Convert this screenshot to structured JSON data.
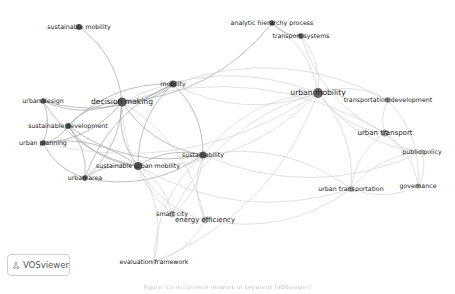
{
  "diagram": {
    "type": "co-occurrence keyword network",
    "nodes": [
      {
        "id": "sustainable_mobility",
        "label": "sustainable mobility",
        "x": 79,
        "y": 27,
        "r": 3,
        "color": "#555555",
        "size": "small"
      },
      {
        "id": "decision_making",
        "label": "decision making",
        "x": 122,
        "y": 102,
        "r": 4.5,
        "color": "#555555",
        "size": "big"
      },
      {
        "id": "mobility",
        "label": "mobility",
        "x": 173,
        "y": 84,
        "r": 3.5,
        "color": "#555555",
        "size": "small"
      },
      {
        "id": "urban_design",
        "label": "urban design",
        "x": 43,
        "y": 101,
        "r": 2.8,
        "color": "#555555",
        "size": "small"
      },
      {
        "id": "sustainable_development",
        "label": "sustainable development",
        "x": 68,
        "y": 126,
        "r": 3,
        "color": "#555555",
        "size": "small"
      },
      {
        "id": "urban_planning",
        "label": "urban planning",
        "x": 43,
        "y": 143,
        "r": 2.8,
        "color": "#555555",
        "size": "small"
      },
      {
        "id": "sustainable_urban_mobility",
        "label": "sustainable urban mobility",
        "x": 138,
        "y": 166,
        "r": 4,
        "color": "#555555",
        "size": "small"
      },
      {
        "id": "urban_area",
        "label": "urban area",
        "x": 85,
        "y": 178,
        "r": 2.8,
        "color": "#555555",
        "size": "small"
      },
      {
        "id": "sustainability",
        "label": "sustainability",
        "x": 203,
        "y": 155,
        "r": 3.5,
        "color": "#555555",
        "size": "small"
      },
      {
        "id": "smart_city",
        "label": "smart city",
        "x": 172,
        "y": 214,
        "r": 3.5,
        "color": "#bbbbbb",
        "size": "small"
      },
      {
        "id": "energy_efficiency",
        "label": "energy efficiency",
        "x": 205,
        "y": 220,
        "r": 3.5,
        "color": "#bbbbbb",
        "size": "med"
      },
      {
        "id": "evaluation_framework",
        "label": "evaluation framework",
        "x": 154,
        "y": 262,
        "r": 2.5,
        "color": "#cccccc",
        "size": "small"
      },
      {
        "id": "analytic_hierarchy_process",
        "label": "analytic hierarchy process",
        "x": 272,
        "y": 23,
        "r": 2.8,
        "color": "#555555",
        "size": "small"
      },
      {
        "id": "transport_systems",
        "label": "transport systems",
        "x": 301,
        "y": 36,
        "r": 2.8,
        "color": "#555555",
        "size": "small"
      },
      {
        "id": "urban_mobility",
        "label": "urban mobility",
        "x": 318,
        "y": 93,
        "r": 5,
        "color": "#666666",
        "size": "big"
      },
      {
        "id": "transportation_development",
        "label": "transportation development",
        "x": 388,
        "y": 100,
        "r": 2.8,
        "color": "#888888",
        "size": "small"
      },
      {
        "id": "urban_transport",
        "label": "urban transport",
        "x": 385,
        "y": 133,
        "r": 3.5,
        "color": "#999999",
        "size": "med"
      },
      {
        "id": "public_policy",
        "label": "public policy",
        "x": 422,
        "y": 152,
        "r": 2.5,
        "color": "#aaaaaa",
        "size": "small"
      },
      {
        "id": "governance",
        "label": "governance",
        "x": 418,
        "y": 186,
        "r": 2.5,
        "color": "#aaaaaa",
        "size": "small"
      },
      {
        "id": "urban_transportation",
        "label": "urban transportation",
        "x": 351,
        "y": 189,
        "r": 3,
        "color": "#aaaaaa",
        "size": "small"
      }
    ],
    "edges": [
      [
        "sustainable_mobility",
        "decision_making"
      ],
      [
        "decision_making",
        "mobility"
      ],
      [
        "decision_making",
        "urban_design"
      ],
      [
        "decision_making",
        "sustainable_development"
      ],
      [
        "decision_making",
        "urban_planning"
      ],
      [
        "decision_making",
        "sustainable_urban_mobility"
      ],
      [
        "decision_making",
        "urban_area"
      ],
      [
        "decision_making",
        "sustainability"
      ],
      [
        "decision_making",
        "urban_mobility"
      ],
      [
        "decision_making",
        "smart_city"
      ],
      [
        "decision_making",
        "energy_efficiency"
      ],
      [
        "decision_making",
        "analytic_hierarchy_process"
      ],
      [
        "decision_making",
        "urban_transport"
      ],
      [
        "mobility",
        "urban_mobility"
      ],
      [
        "mobility",
        "sustainability"
      ],
      [
        "mobility",
        "sustainable_urban_mobility"
      ],
      [
        "mobility",
        "urban_design"
      ],
      [
        "mobility",
        "sustainable_development"
      ],
      [
        "mobility",
        "transportation_development"
      ],
      [
        "mobility",
        "urban_area"
      ],
      [
        "sustainable_development",
        "urban_planning"
      ],
      [
        "sustainable_development",
        "sustainable_urban_mobility"
      ],
      [
        "sustainable_development",
        "urban_area"
      ],
      [
        "sustainable_development",
        "sustainability"
      ],
      [
        "urban_design",
        "urban_planning"
      ],
      [
        "urban_design",
        "sustainable_urban_mobility"
      ],
      [
        "urban_planning",
        "sustainable_urban_mobility"
      ],
      [
        "urban_planning",
        "urban_area"
      ],
      [
        "urban_area",
        "sustainable_urban_mobility"
      ],
      [
        "urban_area",
        "sustainability"
      ],
      [
        "sustainable_urban_mobility",
        "sustainability"
      ],
      [
        "sustainable_urban_mobility",
        "urban_mobility"
      ],
      [
        "sustainable_urban_mobility",
        "smart_city"
      ],
      [
        "sustainable_urban_mobility",
        "energy_efficiency"
      ],
      [
        "sustainable_urban_mobility",
        "evaluation_framework"
      ],
      [
        "sustainable_urban_mobility",
        "urban_transportation"
      ],
      [
        "sustainability",
        "urban_mobility"
      ],
      [
        "sustainability",
        "energy_efficiency"
      ],
      [
        "sustainability",
        "smart_city"
      ],
      [
        "sustainability",
        "evaluation_framework"
      ],
      [
        "sustainability",
        "urban_transportation"
      ],
      [
        "sustainability",
        "public_policy"
      ],
      [
        "smart_city",
        "urban_mobility"
      ],
      [
        "energy_efficiency",
        "urban_transportation"
      ],
      [
        "energy_efficiency",
        "evaluation_framework"
      ],
      [
        "evaluation_framework",
        "urban_mobility"
      ],
      [
        "analytic_hierarchy_process",
        "urban_mobility"
      ],
      [
        "analytic_hierarchy_process",
        "transport_systems"
      ],
      [
        "transport_systems",
        "urban_mobility"
      ],
      [
        "transport_systems",
        "urban_transport"
      ],
      [
        "urban_mobility",
        "transportation_development"
      ],
      [
        "urban_mobility",
        "urban_transport"
      ],
      [
        "urban_mobility",
        "urban_transportation"
      ],
      [
        "urban_mobility",
        "public_policy"
      ],
      [
        "urban_mobility",
        "urban_planning"
      ],
      [
        "transportation_development",
        "urban_transport"
      ],
      [
        "transportation_development",
        "governance"
      ],
      [
        "urban_transport",
        "public_policy"
      ],
      [
        "urban_transport",
        "governance"
      ],
      [
        "urban_transport",
        "urban_transportation"
      ],
      [
        "urban_transportation",
        "public_policy"
      ],
      [
        "urban_transportation",
        "governance"
      ],
      [
        "public_policy",
        "governance"
      ]
    ]
  },
  "logo": {
    "text": "VOSviewer",
    "icon": "vosviewer-logo-icon"
  },
  "caption": {
    "text": "Figure: Co-occurrence network of keywords (VOSviewer)"
  }
}
